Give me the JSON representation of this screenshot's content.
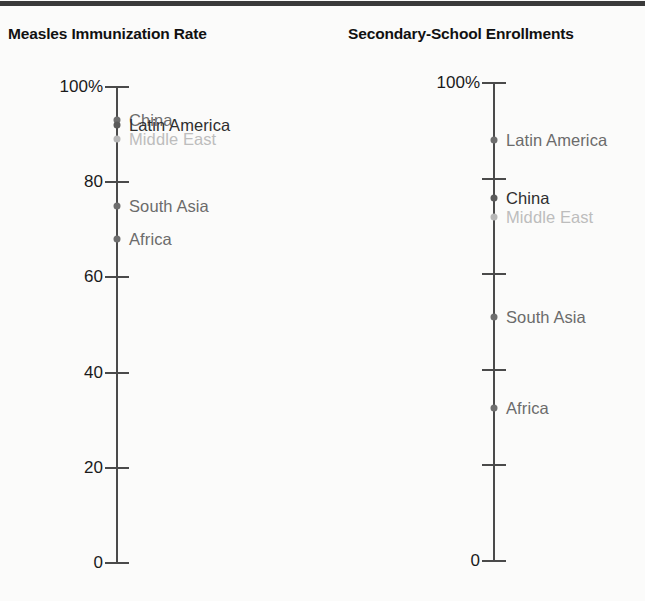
{
  "figure": {
    "background_color": "#fbfbfa",
    "rule_color": "#3a3a3a"
  },
  "panels": [
    {
      "title": "Measles Immunization Rate",
      "axis": {
        "tick_labels": [
          "100%",
          "80",
          "60",
          "40",
          "20",
          "0"
        ],
        "tick_values": [
          100,
          80,
          60,
          40,
          20,
          0
        ]
      },
      "points": [
        {
          "label": "China",
          "value": 93,
          "style": "mid"
        },
        {
          "label": "Latin America",
          "value": 92,
          "style": "dark"
        },
        {
          "label": "Middle East",
          "value": 89,
          "style": "light"
        },
        {
          "label": "South Asia",
          "value": 75,
          "style": "mid"
        },
        {
          "label": "Africa",
          "value": 68,
          "style": "mid"
        }
      ]
    },
    {
      "title": "Secondary-School Enrollments",
      "axis": {
        "tick_labels": [
          "100%",
          "",
          "",
          "",
          "",
          "0"
        ],
        "tick_values": [
          100,
          80,
          60,
          40,
          20,
          0
        ]
      },
      "points": [
        {
          "label": "Latin America",
          "value": 88,
          "style": "mid"
        },
        {
          "label": "China",
          "value": 76,
          "style": "dark"
        },
        {
          "label": "Middle East",
          "value": 72,
          "style": "light"
        },
        {
          "label": "South Asia",
          "value": 51,
          "style": "mid"
        },
        {
          "label": "Africa",
          "value": 32,
          "style": "mid"
        }
      ]
    }
  ],
  "chart_data": {
    "type": "scatter",
    "title": "",
    "xlabel": "",
    "ylabel": "Percent",
    "ylim": [
      0,
      100
    ],
    "grid": false,
    "legend": "none",
    "yticks": [
      0,
      20,
      40,
      60,
      80,
      100
    ],
    "ytick_labels": [
      "0",
      "20",
      "40",
      "60",
      "80",
      "100%"
    ],
    "categories": [
      "China",
      "Latin America",
      "Middle East",
      "South Asia",
      "Africa"
    ],
    "series": [
      {
        "name": "Measles Immunization Rate",
        "values": [
          93,
          92,
          89,
          75,
          68
        ]
      },
      {
        "name": "Secondary-School Enrollments",
        "values": [
          76,
          88,
          72,
          51,
          32
        ]
      }
    ]
  }
}
